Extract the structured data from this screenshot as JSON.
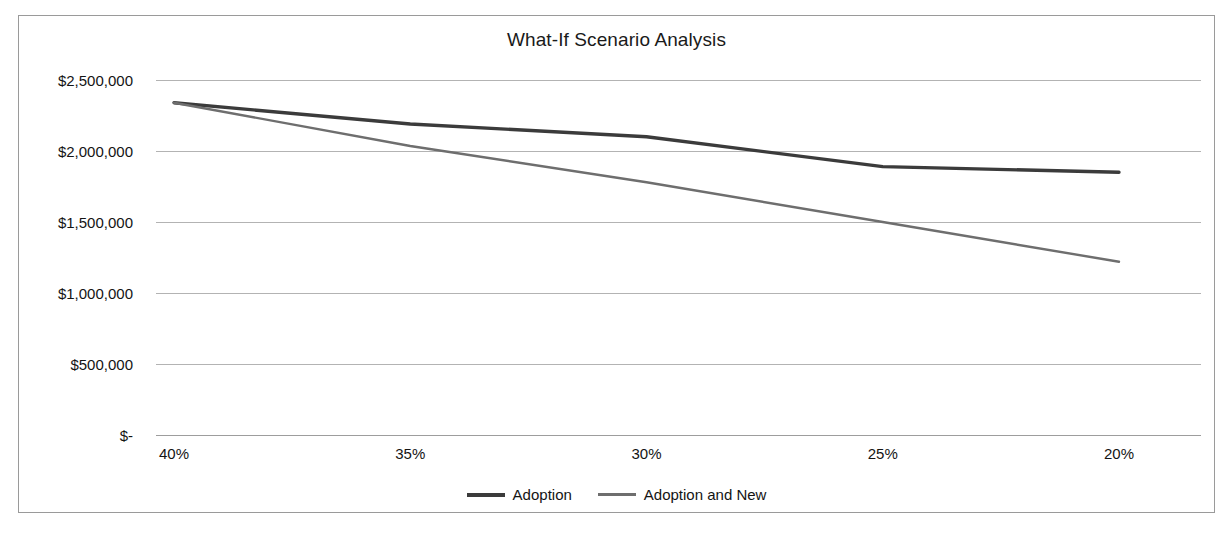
{
  "chart": {
    "title": "What-If Scenario Analysis",
    "legend": [
      {
        "label": "Adoption",
        "color": "#3b3b3b"
      },
      {
        "label": "Adoption and New",
        "color": "#6e6e6e"
      }
    ]
  },
  "chart_data": {
    "type": "line",
    "title": "What-If Scenario Analysis",
    "xlabel": "",
    "ylabel": "",
    "categories": [
      "40%",
      "35%",
      "30%",
      "25%",
      "20%"
    ],
    "series": [
      {
        "name": "Adoption",
        "color": "#3b3b3b",
        "values": [
          2340000,
          2190000,
          2100000,
          1890000,
          1850000
        ]
      },
      {
        "name": "Adoption and New",
        "color": "#6e6e6e",
        "values": [
          2340000,
          2035000,
          1780000,
          1500000,
          1220000
        ]
      }
    ],
    "ylim": [
      0,
      2500000
    ],
    "yticks": [
      0,
      500000,
      1000000,
      1500000,
      2000000,
      2500000
    ],
    "ytick_labels": [
      "$-",
      "$500,000",
      "$1,000,000",
      "$1,500,000",
      "$2,000,000",
      "$2,500,000"
    ],
    "xtick_labels": [
      "40%",
      "35%",
      "30%",
      "25%",
      "20%"
    ],
    "grid": true,
    "legend_position": "bottom"
  }
}
